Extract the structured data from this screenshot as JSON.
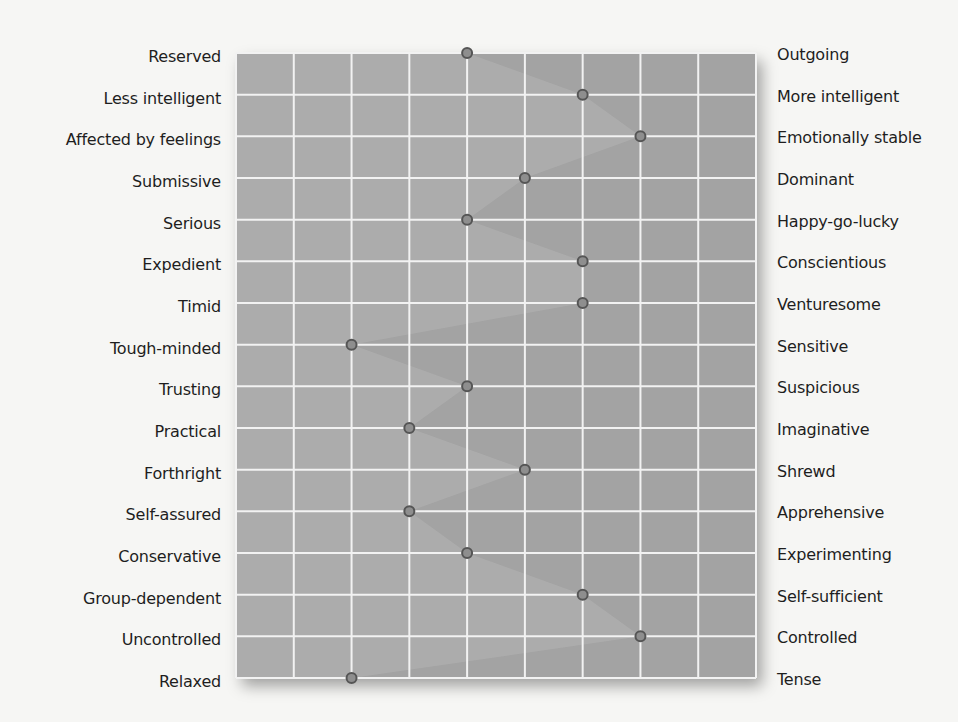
{
  "chart_data": {
    "type": "line",
    "title": "",
    "xlabel": "",
    "ylabel": "",
    "orientation": "horizontal-profile",
    "scale": {
      "min": 0,
      "max": 9,
      "divisions": 9
    },
    "grid": true,
    "traits": [
      {
        "low": "Reserved",
        "high": "Outgoing",
        "value": 4
      },
      {
        "low": "Less intelligent",
        "high": "More intelligent",
        "value": 6
      },
      {
        "low": "Affected by feelings",
        "high": "Emotionally stable",
        "value": 7
      },
      {
        "low": "Submissive",
        "high": "Dominant",
        "value": 5
      },
      {
        "low": "Serious",
        "high": "Happy-go-lucky",
        "value": 4
      },
      {
        "low": "Expedient",
        "high": "Conscientious",
        "value": 6
      },
      {
        "low": "Timid",
        "high": "Venturesome",
        "value": 6
      },
      {
        "low": "Tough-minded",
        "high": "Sensitive",
        "value": 2
      },
      {
        "low": "Trusting",
        "high": "Suspicious",
        "value": 4
      },
      {
        "low": "Practical",
        "high": "Imaginative",
        "value": 3
      },
      {
        "low": "Forthright",
        "high": "Shrewd",
        "value": 5
      },
      {
        "low": "Self-assured",
        "high": "Apprehensive",
        "value": 3
      },
      {
        "low": "Conservative",
        "high": "Experimenting",
        "value": 4
      },
      {
        "low": "Group-dependent",
        "high": "Self-sufficient",
        "value": 6
      },
      {
        "low": "Uncontrolled",
        "high": "Controlled",
        "value": 7
      },
      {
        "low": "Relaxed",
        "high": "Tense",
        "value": 2
      }
    ],
    "colors": {
      "plot_background": "#a3a3a3",
      "grid_lines": "#f2f2f2",
      "profile_band": "#b4b4b4",
      "marker_fill": "#8e8e8e",
      "marker_stroke": "#555555"
    }
  }
}
